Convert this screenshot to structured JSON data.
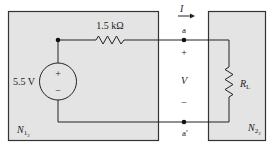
{
  "diagram": {
    "type": "circuit",
    "networks": [
      {
        "id": "N1",
        "label": "N",
        "subscript": "1",
        "sub_subscript": "2"
      },
      {
        "id": "N2",
        "label": "N",
        "subscript": "2",
        "sub_subscript": "2"
      }
    ],
    "source": {
      "label": "5.5 V",
      "plus": "+",
      "minus": "−"
    },
    "series_resistor": {
      "label": "1.5 kΩ"
    },
    "load_resistor": {
      "label": "R",
      "subscript": "L"
    },
    "terminals": {
      "top": "a",
      "bottom": "a′"
    },
    "current": {
      "label": "I"
    },
    "voltage": {
      "label": "V",
      "plus": "+",
      "minus": "−"
    }
  },
  "colors": {
    "box_fill": "#e4e4e4",
    "box_stroke": "#333333",
    "wire": "#222222"
  }
}
